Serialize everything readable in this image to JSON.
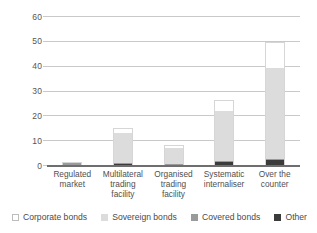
{
  "chart_data": {
    "type": "bar",
    "stacked": true,
    "title": "",
    "subtitle": "",
    "xlabel": "",
    "ylabel": "",
    "ylim": [
      0,
      60
    ],
    "yticks": [
      0,
      10,
      20,
      30,
      40,
      50,
      60
    ],
    "ytick_labels": [
      "0",
      "10",
      "20",
      "30",
      "40",
      "50",
      "60"
    ],
    "grid": true,
    "legend_position": "bottom",
    "categories": [
      "Regulated market",
      "Multilateral trading facility",
      "Organised trading facility",
      "Systematic internaliser",
      "Over the counter"
    ],
    "category_lines": [
      [
        "Regulated",
        "market"
      ],
      [
        "Multilateral",
        "trading",
        "facility"
      ],
      [
        "Organised",
        "trading",
        "facility"
      ],
      [
        "Systematic",
        "internaliser"
      ],
      [
        "Over the",
        "counter"
      ]
    ],
    "series": [
      {
        "name": "Other",
        "color": "#3b3b3b",
        "values": [
          0.3,
          0.8,
          0.5,
          1.5,
          2.4
        ]
      },
      {
        "name": "Covered bonds",
        "color": "#9a9a9a",
        "values": [
          1.2,
          0.4,
          0.3,
          0.4,
          0.6
        ]
      },
      {
        "name": "Sovereign bonds",
        "color": "#dcdcdc",
        "values": [
          0.1,
          12.3,
          6.5,
          20.3,
          36.5
        ]
      },
      {
        "name": "Corporate bonds",
        "color": "#ffffff",
        "values": [
          0.0,
          2.0,
          1.2,
          4.3,
          10.5
        ]
      }
    ],
    "totals": [
      1.6,
      15.5,
      8.5,
      26.5,
      50.0
    ]
  },
  "legend": {
    "items": [
      {
        "label": "Corporate bonds",
        "swatch": "swatch-corporate"
      },
      {
        "label": "Sovereign bonds",
        "swatch": "swatch-sovereign"
      },
      {
        "label": "Covered bonds",
        "swatch": "swatch-covered"
      },
      {
        "label": "Other",
        "swatch": "swatch-other"
      }
    ]
  }
}
